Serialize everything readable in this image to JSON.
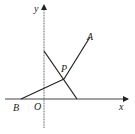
{
  "diagram": {
    "type": "coordinate-geometry",
    "colors": {
      "line": "#222222",
      "axis": "#555555",
      "background": "#ffffff"
    },
    "axes": {
      "x_label": "x",
      "y_label": "y",
      "origin_label": "O"
    },
    "points": [
      {
        "name": "A",
        "label": "A"
      },
      {
        "name": "B",
        "label": "B"
      },
      {
        "name": "P",
        "label": "P"
      }
    ],
    "segments": [
      {
        "from": "B",
        "to": "A",
        "description": "line from B through P to A"
      },
      {
        "from": "y-axis intercept",
        "to": "x-axis intercept",
        "description": "line crossing y-axis and x-axis, through P"
      }
    ]
  }
}
